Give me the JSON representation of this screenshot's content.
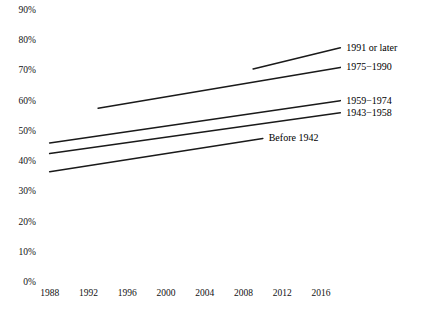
{
  "chart_data": {
    "type": "line",
    "title": "",
    "subtitle": "",
    "xlabel": "",
    "ylabel": "",
    "xlim": [
      1987,
      2019
    ],
    "ylim": [
      0,
      90
    ],
    "grid": false,
    "legend_position": "inline-end-of-line",
    "x_ticks": [
      "1988",
      "1992",
      "1996",
      "2000",
      "2004",
      "2008",
      "2012",
      "2016"
    ],
    "x_tick_values": [
      1988,
      1992,
      1996,
      2000,
      2004,
      2008,
      2012,
      2016
    ],
    "y_ticks": [
      "0%",
      "10%",
      "20%",
      "30%",
      "40%",
      "50%",
      "60%",
      "70%",
      "80%",
      "90%"
    ],
    "y_tick_values": [
      0,
      10,
      20,
      30,
      40,
      50,
      60,
      70,
      80,
      90
    ],
    "line_color": "#1a1a1a",
    "series": [
      {
        "name": "1991 or later",
        "label": "1991 or later",
        "x": [
          2009,
          2018
        ],
        "values": [
          70.5,
          77.5
        ],
        "label_x": 2018.4,
        "label_y": 77.5
      },
      {
        "name": "1975-1990",
        "label": "1975−1990",
        "x": [
          1993,
          2018
        ],
        "values": [
          57.5,
          71.0
        ],
        "label_x": 2018.4,
        "label_y": 71.0
      },
      {
        "name": "1959-1974",
        "label": "1959−1974",
        "x": [
          1988,
          2018
        ],
        "values": [
          46.0,
          60.0
        ],
        "label_x": 2018.4,
        "label_y": 60.0
      },
      {
        "name": "1943-1958",
        "label": "1943−1958",
        "x": [
          1988,
          2018
        ],
        "values": [
          42.5,
          56.0
        ],
        "label_x": 2018.4,
        "label_y": 56.0
      },
      {
        "name": "Before 1942",
        "label": "Before 1942",
        "x": [
          1988,
          2010
        ],
        "values": [
          36.5,
          47.5
        ],
        "label_x": 2010.4,
        "label_y": 47.5
      }
    ]
  }
}
